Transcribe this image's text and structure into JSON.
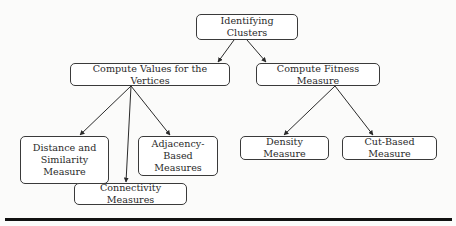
{
  "diagram": {
    "root": {
      "label": "Identifying Clusters"
    },
    "branches": [
      {
        "label": "Compute Values for the Vertices",
        "children": [
          {
            "label": "Distance and Similarity Measure"
          },
          {
            "label": "Connectivity Measures"
          },
          {
            "label": "Adjacency-Based Measures"
          }
        ]
      },
      {
        "label": "Compute Fitness Measure",
        "children": [
          {
            "label": "Density Measure"
          },
          {
            "label": "Cut-Based Measure"
          }
        ]
      }
    ],
    "colors": {
      "stroke": "#3a3a3a",
      "text": "#2a2a2a",
      "background": "#fbfbfa",
      "rule": "#111111"
    }
  }
}
